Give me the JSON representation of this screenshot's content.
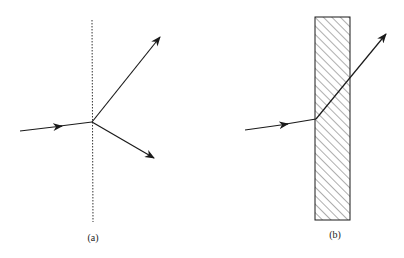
{
  "figure": {
    "panel_a": {
      "label": "(a)",
      "description": "Ray incident on interface splitting into reflected and refracted rays"
    },
    "panel_b": {
      "label": "(b)",
      "description": "Ray entering a hatched slab and refracting out"
    }
  },
  "colors": {
    "stroke": "#1a1a1a",
    "background": "#ffffff"
  }
}
